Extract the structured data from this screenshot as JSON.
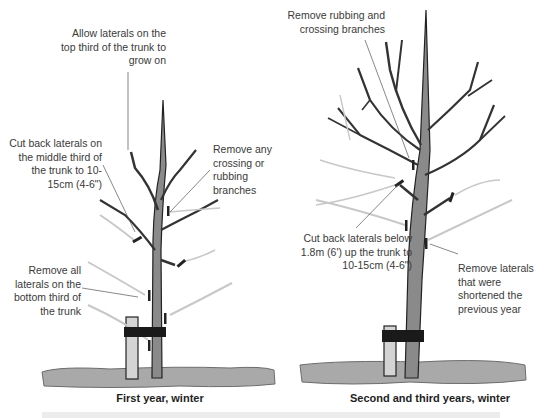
{
  "panels": [
    {
      "caption": "First year, winter",
      "annotations": {
        "top": "Allow laterals on the top third of the trunk to grow on",
        "middle": "Cut back laterals on the middle third of the trunk to 10-15cm (4-6\")",
        "crossing": "Remove any crossing or rubbing branches",
        "bottom": "Remove all laterals on the bottom third of the trunk"
      }
    },
    {
      "caption": "Second and third years, winter",
      "annotations": {
        "rubbing": "Remove rubbing and crossing branches",
        "cut_back": "Cut back laterals below 1.8m (6') up the trunk to 10-15cm (4-6\")",
        "shortened": "Remove laterals that were shortened the previous year"
      }
    }
  ],
  "colors": {
    "ground": "#a9a9a9",
    "trunk": "#8a8a8a",
    "outline": "#222222",
    "tie": "#1a1a1a",
    "stake": "#d4d4d4",
    "pruned": "#c8c8c8",
    "band": "#ececec"
  }
}
